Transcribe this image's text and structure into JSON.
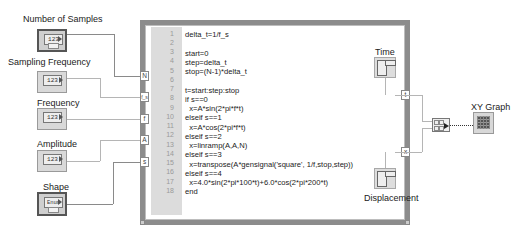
{
  "controls": [
    {
      "label": "Number of Samples",
      "glyph": "123",
      "type": "numeric-i32"
    },
    {
      "label": "Sampling Frequency",
      "glyph": "123",
      "type": "numeric-dbl"
    },
    {
      "label": "Frequency",
      "glyph": "123",
      "type": "numeric-dbl"
    },
    {
      "label": "Amplitude",
      "glyph": "123",
      "type": "numeric-dbl"
    },
    {
      "label": "Shape",
      "glyph": "Enum",
      "type": "enum"
    }
  ],
  "mathscript": {
    "inputs": [
      "N",
      "f_s",
      "f",
      "A",
      "s"
    ],
    "outputs": [
      "t",
      "x"
    ],
    "line_numbers": [
      "1",
      "2",
      "3",
      "4",
      "5",
      "6",
      "7",
      "8",
      "9",
      "10",
      "11",
      "12",
      "13",
      "14",
      "15",
      "16",
      "17",
      "18"
    ],
    "lines": [
      "delta_t=1/f_s",
      "",
      "start=0",
      "step=delta_t",
      "stop=(N-1)*delta_t",
      "",
      "t=start:step:stop",
      "if s==0",
      "  x=A*sin(2*pi*f*t)",
      "elseif s==1",
      "  x=A*cos(2*pi*f*t)",
      "elseif s==2",
      "  x=linramp(A,A,N)",
      "elseif s==3",
      "  x=transpose(A*gensignal('square', 1/f,stop,step))",
      "elseif s==4",
      "  x=4.0*sin(2*pi*100*t)+6.0*cos(2*pi*200*t)",
      "end"
    ]
  },
  "indicators": [
    {
      "label": "Time"
    },
    {
      "label": "Displacement"
    }
  ],
  "graph": {
    "label": "XY Graph"
  },
  "colors": {
    "wire": "#b5b5b5",
    "node_frame": "#8c8c8c",
    "gutter": "#dcdcdc"
  }
}
